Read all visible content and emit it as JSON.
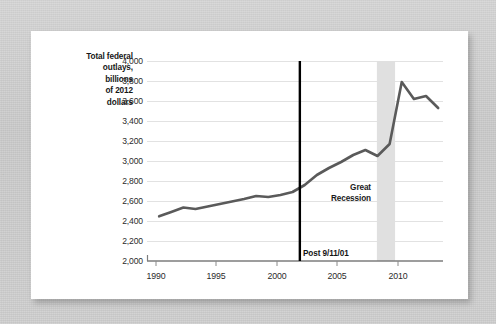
{
  "figure": {
    "background_color": "#c9c9c9",
    "card_color": "#ffffff",
    "accent_line_color": "#5a5a5a",
    "event_line_color": "#000000",
    "recession_band_color": "#e0e0e0",
    "gridline_color": "#e2e2e2"
  },
  "chart_data": {
    "type": "line",
    "title": "",
    "xlabel": "",
    "ylabel": "Total federal outlays, billions of 2012 dollars",
    "ylabel_lines": [
      "Total federal",
      "outlays,",
      "billions",
      "of 2012",
      "dollars"
    ],
    "xlim": [
      1989.0,
      2013.4
    ],
    "ylim": [
      2000,
      4000
    ],
    "ytick_labels": [
      "4,000",
      "3,800",
      "3,600",
      "3,400",
      "3,200",
      "3,000",
      "2,800",
      "2,600",
      "2,400",
      "2,200",
      "2,000"
    ],
    "ytick_values": [
      4000,
      3800,
      3600,
      3400,
      3200,
      3000,
      2800,
      2600,
      2400,
      2200,
      2000
    ],
    "xtick_labels": [
      "1990",
      "1995",
      "2000",
      "2005",
      "2010"
    ],
    "xtick_values": [
      1990,
      1995,
      2000,
      2005,
      2010
    ],
    "grid": true,
    "grid_axis": "y",
    "legend": false,
    "series": [
      {
        "name": "Total federal outlays",
        "color": "#5a5a5a",
        "x": [
          1990,
          1991,
          1992,
          1993,
          1994,
          1995,
          1996,
          1997,
          1998,
          1999,
          2000,
          2001,
          2002,
          2003,
          2004,
          2005,
          2006,
          2007,
          2008,
          2009,
          2010,
          2011,
          2012,
          2013
        ],
        "values": [
          2447,
          2490,
          2535,
          2520,
          2545,
          2570,
          2595,
          2620,
          2650,
          2640,
          2660,
          2690,
          2760,
          2860,
          2930,
          2990,
          3060,
          3110,
          3050,
          3170,
          3790,
          3620,
          3650,
          3530
        ]
      }
    ],
    "annotations": [
      {
        "name": "post-911-event",
        "label": "Post 9/11/01",
        "type": "vline",
        "x": 2001.6,
        "color": "#000000"
      },
      {
        "name": "great-recession-band",
        "label": "Great Recession",
        "label_lines": [
          "Great",
          "Recession"
        ],
        "type": "vspan",
        "x_start": 2007.95,
        "x_end": 2009.45,
        "color": "#e0e0e0"
      }
    ]
  }
}
